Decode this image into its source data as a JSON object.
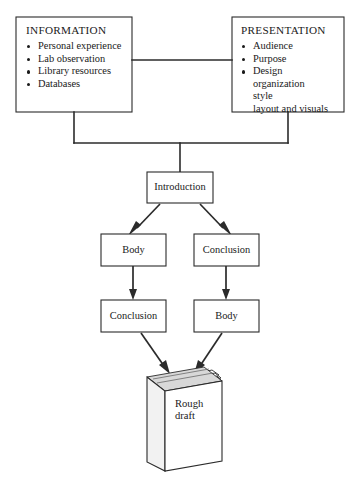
{
  "diagram": {
    "title_information": "INFORMATION",
    "title_presentation": "PRESENTATION",
    "information_items": [
      "Personal experience",
      "Lab observation",
      "Library resources",
      "Databases"
    ],
    "presentation_items": [
      "Audience",
      "Purpose",
      "Design"
    ],
    "presentation_subitems": [
      "organization",
      "style",
      "layout and visuals"
    ],
    "node_introduction": "Introduction",
    "node_body_left": "Body",
    "node_conclusion_right": "Conclusion",
    "node_conclusion_left": "Conclusion",
    "node_body_right": "Body",
    "book_label_line1": "Rough",
    "book_label_line2": "draft",
    "colors": {
      "line": "#2b2b2b",
      "text": "#1a1a1a",
      "background": "#ffffff",
      "book_shade": "#d8d8d8"
    }
  }
}
